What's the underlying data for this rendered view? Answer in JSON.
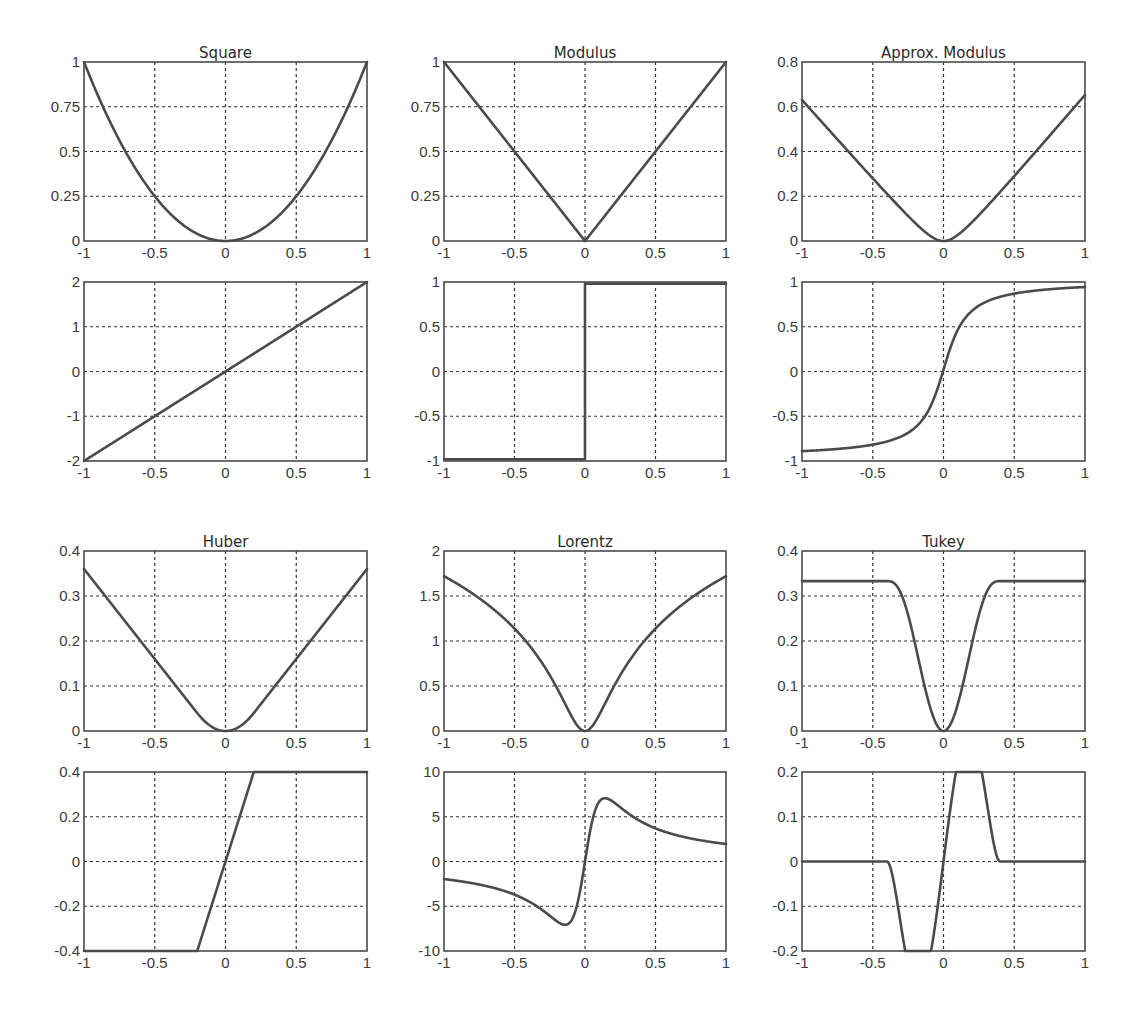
{
  "figure": {
    "colors": {
      "line": "#4b4b4b",
      "grid": "#333333",
      "axes": "#4a4a4a",
      "text": "#3a3a3a",
      "background": "#ffffff"
    }
  },
  "chart_data": [
    {
      "id": "square",
      "type": "line",
      "title": "Square",
      "xlabel": "",
      "ylabel": "",
      "xlim": [
        -1,
        1
      ],
      "ylim": [
        0,
        1
      ],
      "grid": true,
      "xticks": [
        "-1",
        "-0.5",
        "0",
        "0.5",
        "1"
      ],
      "yticks": [
        "0",
        "0.25",
        "0.5",
        "0.75",
        "1"
      ],
      "function": "x^2",
      "x": [
        -1,
        -0.75,
        -0.5,
        -0.25,
        0,
        0.25,
        0.5,
        0.75,
        1
      ],
      "y": [
        1,
        0.5625,
        0.25,
        0.0625,
        0,
        0.0625,
        0.25,
        0.5625,
        1
      ]
    },
    {
      "id": "modulus",
      "type": "line",
      "title": "Modulus",
      "xlabel": "",
      "ylabel": "",
      "xlim": [
        -1,
        1
      ],
      "ylim": [
        0,
        1
      ],
      "grid": true,
      "xticks": [
        "-1",
        "-0.5",
        "0",
        "0.5",
        "1"
      ],
      "yticks": [
        "0",
        "0.25",
        "0.5",
        "0.75",
        "1"
      ],
      "function": "|x|",
      "x": [
        -1,
        -0.5,
        0,
        0.5,
        1
      ],
      "y": [
        1,
        0.5,
        0,
        0.5,
        1
      ]
    },
    {
      "id": "approx-modulus",
      "type": "line",
      "title": "Approx. Modulus",
      "xlabel": "",
      "ylabel": "",
      "xlim": [
        -1,
        1
      ],
      "ylim": [
        0,
        0.8
      ],
      "grid": true,
      "xticks": [
        "-1",
        "-0.5",
        "0",
        "0.5",
        "1"
      ],
      "yticks": [
        "0",
        "0.2",
        "0.4",
        "0.6",
        "0.8"
      ],
      "function": "smooth |x| approximation",
      "x": [
        -1,
        -0.75,
        -0.5,
        -0.25,
        0,
        0.25,
        0.5,
        0.75,
        1
      ],
      "y": [
        0.63,
        0.43,
        0.25,
        0.09,
        0,
        0.09,
        0.25,
        0.43,
        0.65
      ]
    },
    {
      "id": "square-derivative",
      "type": "line",
      "title": "",
      "xlabel": "",
      "ylabel": "",
      "xlim": [
        -1,
        1
      ],
      "ylim": [
        -2,
        2
      ],
      "grid": true,
      "xticks": [
        "-1",
        "-0.5",
        "0",
        "0.5",
        "1"
      ],
      "yticks": [
        "-2",
        "-1",
        "0",
        "1",
        "2"
      ],
      "function": "2x",
      "x": [
        -1,
        0,
        1
      ],
      "y": [
        -2,
        0,
        2
      ]
    },
    {
      "id": "modulus-derivative",
      "type": "line",
      "title": "",
      "xlabel": "",
      "ylabel": "",
      "xlim": [
        -1,
        1
      ],
      "ylim": [
        -1,
        1
      ],
      "grid": true,
      "xticks": [
        "-1",
        "-0.5",
        "0",
        "0.5",
        "1"
      ],
      "yticks": [
        "-1",
        "-0.5",
        "0",
        "0.5",
        "1"
      ],
      "function": "sign(x)",
      "x": [
        -1,
        0,
        0,
        1
      ],
      "y": [
        -0.98,
        -0.98,
        0.98,
        0.98
      ]
    },
    {
      "id": "approx-modulus-derivative",
      "type": "line",
      "title": "",
      "xlabel": "",
      "ylabel": "",
      "xlim": [
        -1,
        1
      ],
      "ylim": [
        -1,
        1
      ],
      "grid": true,
      "xticks": [
        "-1",
        "-0.5",
        "0",
        "0.5",
        "1"
      ],
      "yticks": [
        "-1",
        "-0.5",
        "0",
        "0.5",
        "1"
      ],
      "function": "smooth sign",
      "x": [
        -1,
        -0.75,
        -0.5,
        -0.25,
        -0.1,
        0,
        0.1,
        0.25,
        0.5,
        0.75,
        1
      ],
      "y": [
        -0.82,
        -0.77,
        -0.7,
        -0.55,
        -0.3,
        0.05,
        0.35,
        0.58,
        0.73,
        0.8,
        0.86
      ]
    },
    {
      "id": "huber",
      "type": "line",
      "title": "Huber",
      "xlabel": "",
      "ylabel": "",
      "xlim": [
        -1,
        1
      ],
      "ylim": [
        0,
        0.4
      ],
      "grid": true,
      "xticks": [
        "-1",
        "-0.5",
        "0",
        "0.5",
        "1"
      ],
      "yticks": [
        "0",
        "0.1",
        "0.2",
        "0.3",
        "0.4"
      ],
      "function": "Huber, k=0.2",
      "x": [
        -1,
        -0.5,
        -0.2,
        0,
        0.2,
        0.5,
        1
      ],
      "y": [
        0.36,
        0.16,
        0.04,
        0,
        0.04,
        0.16,
        0.36
      ]
    },
    {
      "id": "lorentz",
      "type": "line",
      "title": "Lorentz",
      "xlabel": "",
      "ylabel": "",
      "xlim": [
        -1,
        1
      ],
      "ylim": [
        0,
        2
      ],
      "grid": true,
      "xticks": [
        "-1",
        "-0.5",
        "0",
        "0.5",
        "1"
      ],
      "yticks": [
        "0",
        "0.5",
        "1",
        "1.5",
        "2"
      ],
      "function": "log(1 + x^2/(2*0.1^2))",
      "x": [
        -1,
        -0.75,
        -0.5,
        -0.25,
        0,
        0.25,
        0.5,
        0.75,
        1
      ],
      "y": [
        1.72,
        1.45,
        1.11,
        0.6,
        0,
        0.6,
        1.11,
        1.45,
        1.72
      ]
    },
    {
      "id": "tukey",
      "type": "line",
      "title": "Tukey",
      "xlabel": "",
      "ylabel": "",
      "xlim": [
        -1,
        1
      ],
      "ylim": [
        0,
        0.4
      ],
      "grid": true,
      "xticks": [
        "-1",
        "-0.5",
        "0",
        "0.5",
        "1"
      ],
      "yticks": [
        "0",
        "0.1",
        "0.2",
        "0.3",
        "0.4"
      ],
      "function": "Tukey biweight, c=0.4",
      "x": [
        -1,
        -0.4,
        -0.3,
        -0.2,
        -0.1,
        0,
        0.1,
        0.2,
        0.3,
        0.4,
        1
      ],
      "y": [
        0.333,
        0.333,
        0.31,
        0.21,
        0.07,
        0,
        0.07,
        0.21,
        0.31,
        0.333,
        0.333
      ]
    },
    {
      "id": "huber-derivative",
      "type": "line",
      "title": "",
      "xlabel": "",
      "ylabel": "",
      "xlim": [
        -1,
        1
      ],
      "ylim": [
        -0.4,
        0.4
      ],
      "grid": true,
      "xticks": [
        "-1",
        "-0.5",
        "0",
        "0.5",
        "1"
      ],
      "yticks": [
        "-0.4",
        "-0.2",
        "0",
        "0.2",
        "0.4"
      ],
      "function": "clip(2x, -0.4, 0.4)",
      "x": [
        -1,
        -0.2,
        0.2,
        1
      ],
      "y": [
        -0.4,
        -0.4,
        0.4,
        0.4
      ]
    },
    {
      "id": "lorentz-derivative",
      "type": "line",
      "title": "",
      "xlabel": "",
      "ylabel": "",
      "xlim": [
        -1,
        1
      ],
      "ylim": [
        -10,
        10
      ],
      "grid": true,
      "xticks": [
        "-1",
        "-0.5",
        "0",
        "0.5",
        "1"
      ],
      "yticks": [
        "-10",
        "-5",
        "0",
        "5",
        "10"
      ],
      "function": "2x/(2*0.1^2 + x^2)",
      "x": [
        -1,
        -0.75,
        -0.5,
        -0.3,
        -0.14,
        -0.05,
        0,
        0.05,
        0.14,
        0.3,
        0.5,
        0.75,
        1
      ],
      "y": [
        -1.96,
        -2.6,
        -3.7,
        -5.45,
        -7.07,
        -4.44,
        0,
        4.44,
        7.07,
        5.45,
        3.7,
        2.6,
        1.96
      ]
    },
    {
      "id": "tukey-derivative",
      "type": "line",
      "title": "",
      "xlabel": "",
      "ylabel": "",
      "xlim": [
        -1,
        1
      ],
      "ylim": [
        -0.2,
        0.2
      ],
      "grid": true,
      "xticks": [
        "-1",
        "-0.5",
        "0",
        "0.5",
        "1"
      ],
      "yticks": [
        "-0.2",
        "-0.1",
        "0",
        "0.1",
        "0.2"
      ],
      "function": "Tukey psi, c=0.4",
      "x": [
        -1,
        -0.4,
        -0.3,
        -0.18,
        -0.1,
        0,
        0.1,
        0.18,
        0.3,
        0.4,
        1
      ],
      "y": [
        0,
        0,
        -0.066,
        -0.115,
        -0.09,
        0,
        0.09,
        0.115,
        0.066,
        0,
        0
      ]
    }
  ]
}
